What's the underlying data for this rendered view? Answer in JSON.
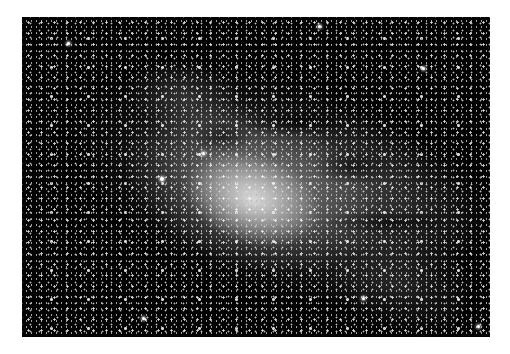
{
  "image": {
    "subject": "Milky Way galactic center star field",
    "palette": {
      "background": "#ffffff",
      "sky": "#020202",
      "core": "#e8e8e8",
      "stars": "#ffffff"
    },
    "frame": {
      "left": 22,
      "top": 17,
      "width": 468,
      "height": 320
    }
  }
}
